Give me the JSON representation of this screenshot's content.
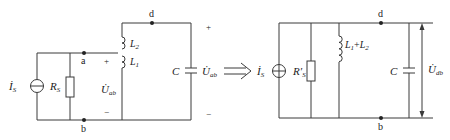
{
  "left_circuit": {
    "nodes": {
      "a": "a",
      "b": "b",
      "d": "d"
    },
    "source": {
      "symbol": "İ",
      "subscript": "S"
    },
    "resistor": {
      "symbol": "R",
      "subscript": "S"
    },
    "inductor_top": {
      "symbol": "L",
      "subscript": "2"
    },
    "inductor_bottom": {
      "symbol": "L",
      "subscript": "1"
    },
    "capacitor": {
      "symbol": "C"
    },
    "voltage_ab": {
      "symbol": "U̇",
      "subscript": "ab",
      "plus": "+",
      "minus": "−"
    },
    "voltage_cap": {
      "symbol": "U̇",
      "subscript": "ab",
      "plus": "+",
      "minus": "−"
    }
  },
  "transform_arrow": {
    "symbol": "⟹"
  },
  "right_circuit": {
    "nodes": {
      "d": "d",
      "b": "b"
    },
    "source": {
      "symbol": "İ",
      "subscript": "S"
    },
    "resistor": {
      "symbol": "R′",
      "subscript": "S"
    },
    "inductor": {
      "label": "L",
      "sub1": "1",
      "plus": "+",
      "label2": "L",
      "sub2": "2"
    },
    "capacitor": {
      "symbol": "C"
    },
    "voltage_db": {
      "symbol": "U̇",
      "subscript": "db"
    }
  },
  "colors": {
    "line": "#3a3a3a",
    "text": "#222222",
    "background": "#ffffff"
  }
}
